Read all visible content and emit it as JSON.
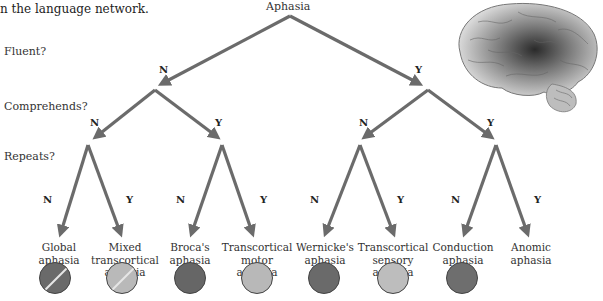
{
  "caption": "n the language network.",
  "questions": {
    "fluent": "Fluent?",
    "comprehends": "Comprehends?",
    "repeats": "Repeats?"
  },
  "root": "Aphasia",
  "branch_labels": {
    "no": "N",
    "yes": "Y"
  },
  "colors": {
    "arrow": "#6b6b6b",
    "dark_circle": "#6a6a6a",
    "light_circle": "#b9b9b9"
  },
  "leaves": [
    {
      "line1": "Global",
      "line2": "aphasia",
      "line3": "",
      "shade": "dark",
      "striped": true
    },
    {
      "line1": "Mixed",
      "line2": "transcortical",
      "line3": "aphasia",
      "shade": "light",
      "striped": true
    },
    {
      "line1": "Broca's",
      "line2": "aphasia",
      "line3": "",
      "shade": "dark",
      "striped": false
    },
    {
      "line1": "Transcortical",
      "line2": "motor",
      "line3": "aphasia",
      "shade": "light",
      "striped": false
    },
    {
      "line1": "Wernicke's",
      "line2": "aphasia",
      "line3": "",
      "shade": "dark",
      "striped": false
    },
    {
      "line1": "Transcortical",
      "line2": "sensory",
      "line3": "aphasia",
      "shade": "light",
      "striped": false
    },
    {
      "line1": "Conduction",
      "line2": "aphasia",
      "line3": "",
      "shade": "dark",
      "striped": false
    },
    {
      "line1": "Anomic",
      "line2": "aphasia",
      "line3": "",
      "shade": "none",
      "striped": false
    }
  ]
}
